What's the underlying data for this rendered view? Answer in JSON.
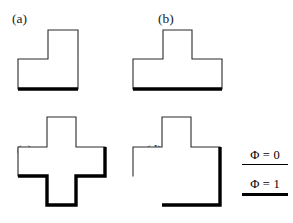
{
  "figure": {
    "background_color": "#ffffff",
    "line_color_thin": "#2b2b2b",
    "line_color_thick": "#000000",
    "panels": [
      {
        "id": "a",
        "label": "(a)",
        "shape_name": "L-shaped polyomino",
        "outline_points": "18,59 48,59 48,30 78,30 78,89 18,89",
        "thin_path": "M 18,89 L 18,59 L 48,59 L 48,30 L 78,30 L 78,89",
        "thick_path": "M 18,89 L 78,89",
        "thick_edges": [
          "bottom"
        ]
      },
      {
        "id": "b",
        "label": "(b)",
        "shape_name": "T-shaped polyomino",
        "outline_points": "8,59 38,59 38,30 67,30 67,59 97,59 97,89 8,89",
        "thin_path": "M 8,89 L 8,59 L 38,59 L 38,30 L 67,30 L 67,59 L 97,59 L 97,89",
        "thick_path": "M 8,89 L 97,89",
        "thick_edges": [
          "bottom"
        ]
      },
      {
        "id": "c",
        "label": "(c)",
        "shape_name": "Plus-shaped polyomino",
        "outline_points": "18,40 47,40 47,10 76,10 76,40 105,40 105,69 76,69 76,98 47,98 47,69 18,69",
        "thin_path": "M 18,69 L 18,40 L 47,40 L 47,10 L 76,10 L 76,40 L 105,40",
        "thick_path": "M 105,40 L 105,69 L 76,69 L 76,98 L 47,98 L 47,69 L 18,69",
        "thick_edges": [
          "right-arm-top-stub",
          "right",
          "lower-right-step",
          "bottom",
          "lower-left-step"
        ]
      },
      {
        "id": "d",
        "label": "(d)",
        "shape_name": "Cross-with-filled-corner polyomino",
        "outline_points": "8,40 37,40 37,10 66,10 66,40 95,40 95,98 37,98 37,69 8,69",
        "thin_path": "M 8,69 L 8,40 L 37,40 L 37,10 L 66,10 L 66,40 L 95,40",
        "thick_path": "M 95,40 L 95,98 L 37,98",
        "thick_edges": [
          "right",
          "bottom"
        ]
      }
    ]
  },
  "legend": {
    "entries": [
      {
        "text": "Φ = 0",
        "rule_style": "thin",
        "symbol": "Phi",
        "value": "0"
      },
      {
        "text": "Φ = 1",
        "rule_style": "thick",
        "symbol": "Phi",
        "value": "1"
      }
    ]
  }
}
